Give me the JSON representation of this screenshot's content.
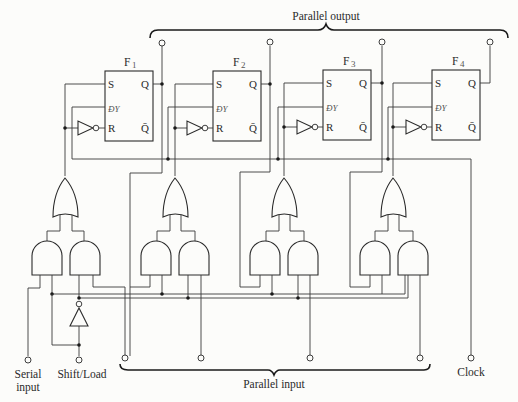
{
  "diagram": {
    "title_top": "Parallel output",
    "title_bottom": "Parallel input",
    "flipflops": [
      {
        "name": "F",
        "sub": "1",
        "s": "S",
        "clk": "ƉΥ",
        "r": "R",
        "q": "Q",
        "qbar": "Q̄"
      },
      {
        "name": "F",
        "sub": "2",
        "s": "S",
        "clk": "ƉΥ",
        "r": "R",
        "q": "Q",
        "qbar": "Q̄"
      },
      {
        "name": "F",
        "sub": "3",
        "s": "S",
        "clk": "ƉΥ",
        "r": "R",
        "q": "Q",
        "qbar": "Q̄"
      },
      {
        "name": "F",
        "sub": "4",
        "s": "S",
        "clk": "ƉΥ",
        "r": "R",
        "q": "Q",
        "qbar": "Q̄"
      }
    ],
    "inputs": {
      "serial_line1": "Serial",
      "serial_line2": "input",
      "shift_load": "Shift/Load",
      "clock": "Clock"
    },
    "components": {
      "flipflop_type": "SR flip-flop",
      "flipflop_count": 4,
      "or_gates": 4,
      "and_gates": 8,
      "inverters": 5
    }
  }
}
